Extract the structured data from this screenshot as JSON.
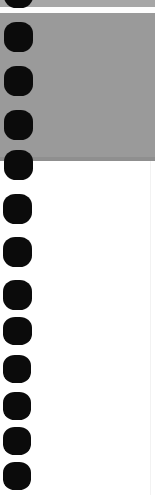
{
  "document": {
    "kind": "scanned-page-margin",
    "width_px": 155,
    "height_px": 495,
    "description": "Left margin of a scanned spiral/comb-bound page showing punch holes",
    "page_background_color": "#ffffff",
    "hole_color": "#0b0b0b"
  },
  "scan_artifacts": {
    "top_sliver": {
      "label": "top gray sliver",
      "color": "#a6a6a6",
      "top": 0,
      "height": 7
    },
    "seam": {
      "label": "white scan seam",
      "color": "#fdfdfd",
      "top": 7,
      "height": 6
    },
    "shadow_band": {
      "label": "scanner lid shadow band",
      "color": "#9a9a9a",
      "top": 13,
      "height": 148
    },
    "shadow_band_edge": {
      "label": "shadow band lower edge",
      "color": "#8f8f8f",
      "top": 157,
      "height": 4
    },
    "paper_area": {
      "label": "white paper area",
      "color": "#ffffff",
      "top": 161,
      "height": 334
    },
    "right_edge_line": {
      "label": "faint right scan edge",
      "color": "#f2f2f2",
      "left": 150,
      "top": 161,
      "height": 334
    }
  },
  "punch_holes": [
    {
      "id": "hole-00",
      "left": 4,
      "top": -22,
      "width": 29,
      "height": 30,
      "clipped": "top"
    },
    {
      "id": "hole-01",
      "left": 4,
      "top": 22,
      "width": 29,
      "height": 30,
      "clipped": "none"
    },
    {
      "id": "hole-02",
      "left": 4,
      "top": 66,
      "width": 29,
      "height": 30,
      "clipped": "none"
    },
    {
      "id": "hole-03",
      "left": 4,
      "top": 110,
      "width": 29,
      "height": 30,
      "clipped": "none"
    },
    {
      "id": "hole-04",
      "left": 4,
      "top": 150,
      "width": 29,
      "height": 30,
      "clipped": "none"
    },
    {
      "id": "hole-05",
      "left": 3,
      "top": 194,
      "width": 29,
      "height": 30,
      "clipped": "none"
    },
    {
      "id": "hole-06",
      "left": 3,
      "top": 237,
      "width": 29,
      "height": 30,
      "clipped": "none"
    },
    {
      "id": "hole-07",
      "left": 3,
      "top": 280,
      "width": 29,
      "height": 30,
      "clipped": "none"
    },
    {
      "id": "hole-08",
      "left": 3,
      "top": 317,
      "width": 29,
      "height": 28,
      "clipped": "none"
    },
    {
      "id": "hole-09",
      "left": 3,
      "top": 355,
      "width": 28,
      "height": 28,
      "clipped": "none"
    },
    {
      "id": "hole-10",
      "left": 3,
      "top": 392,
      "width": 28,
      "height": 28,
      "clipped": "none"
    },
    {
      "id": "hole-11",
      "left": 3,
      "top": 427,
      "width": 28,
      "height": 28,
      "clipped": "none"
    },
    {
      "id": "hole-12",
      "left": 3,
      "top": 462,
      "width": 28,
      "height": 28,
      "clipped": "none"
    }
  ]
}
